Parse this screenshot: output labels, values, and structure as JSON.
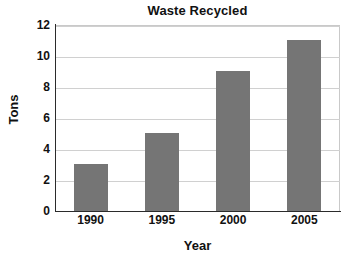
{
  "chart_data": {
    "type": "bar",
    "title": "Waste Recycled",
    "xlabel": "Year",
    "ylabel": "Tons",
    "categories": [
      "1990",
      "1995",
      "2000",
      "2005"
    ],
    "values": [
      3,
      5,
      9,
      11
    ],
    "ylim": [
      0,
      12
    ],
    "yticks": [
      "0",
      "2",
      "4",
      "6",
      "8",
      "10",
      "12"
    ],
    "ytick_values": [
      0,
      2,
      4,
      6,
      8,
      10,
      12
    ],
    "grid": "horizontal",
    "legend": "none",
    "bar_color": "#757575",
    "grid_color": "#d0d0d0",
    "axis_color": "#2b2b2b",
    "background_color": "#ffffff",
    "text_color": "#111111"
  }
}
